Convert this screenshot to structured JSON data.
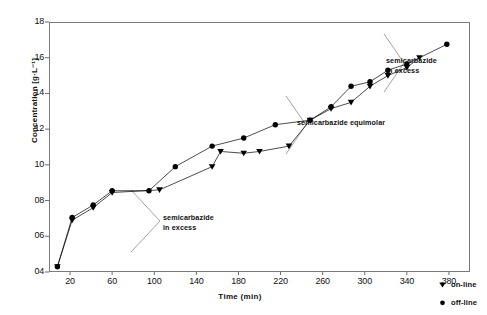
{
  "chart_data": {
    "type": "line",
    "title": "",
    "xlabel": "Time  (min)",
    "ylabel": "Concentration [g·L⁻¹]",
    "xlim": [
      0,
      400
    ],
    "ylim": [
      0.4,
      1.8
    ],
    "xticks": [
      20,
      60,
      100,
      140,
      180,
      220,
      260,
      300,
      340,
      380
    ],
    "xticklabels": [
      "20",
      "60",
      "100",
      "140",
      "180",
      "220",
      "260",
      "300",
      "340",
      "380"
    ],
    "yticks": [
      0.4,
      0.6,
      0.8,
      1.0,
      1.2,
      1.4,
      1.6,
      1.8
    ],
    "yticklabels": [
      "04",
      "06",
      "08",
      "10",
      "12",
      "14",
      "16",
      "18"
    ],
    "grid": false,
    "legend_position": "bottom-right",
    "series": [
      {
        "name": "on-line",
        "marker": "triangle-down",
        "color": "#000000",
        "x": [
          8,
          22,
          42,
          60,
          105,
          155,
          163,
          185,
          200,
          228,
          248,
          268,
          287,
          305,
          322,
          340,
          352
        ],
        "y": [
          0.43,
          0.69,
          0.76,
          0.845,
          0.86,
          0.99,
          1.075,
          1.065,
          1.075,
          1.105,
          1.25,
          1.315,
          1.35,
          1.44,
          1.5,
          1.545,
          1.6
        ]
      },
      {
        "name": "off-line",
        "marker": "circle",
        "color": "#000000",
        "x": [
          8,
          22,
          42,
          60,
          95,
          120,
          155,
          185,
          215,
          248,
          268,
          287,
          305,
          322,
          340,
          378
        ],
        "y": [
          0.43,
          0.705,
          0.775,
          0.855,
          0.855,
          0.99,
          1.105,
          1.15,
          1.225,
          1.25,
          1.325,
          1.44,
          1.465,
          1.53,
          1.565,
          1.675
        ]
      }
    ],
    "annotations": [
      {
        "id": "anno-top-right",
        "text": "semicarbazide\nin excess"
      },
      {
        "id": "anno-middle",
        "text": "semicarbazide equimolar"
      },
      {
        "id": "anno-bottom-left",
        "text": "semicarbazide\nin excess"
      }
    ]
  },
  "legend": {
    "items": [
      {
        "label": "on-line",
        "marker": "triangle-down"
      },
      {
        "label": "off-line",
        "marker": "circle"
      }
    ]
  }
}
